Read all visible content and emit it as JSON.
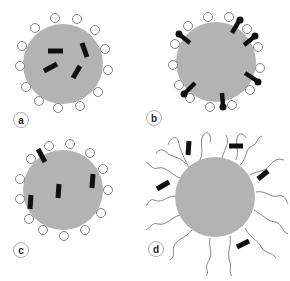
{
  "figure": {
    "colors": {
      "particle": "#b3b3b3",
      "marker": "#111111",
      "open_circle_stroke": "#777777",
      "chain": "#666666",
      "label_ring": "#999999"
    },
    "panels": [
      {
        "id": "a",
        "label": "a",
        "description": "Particle with internal rod markers and surface open circles"
      },
      {
        "id": "b",
        "label": "b",
        "description": "Particle with surface-anchored rods ending in filled dots, plus open circles"
      },
      {
        "id": "c",
        "label": "c",
        "description": "Particle with rods partly embedded, plus surface open circles"
      },
      {
        "id": "d",
        "label": "d",
        "description": "Particle with polymer chains and rods in the corona"
      }
    ]
  }
}
